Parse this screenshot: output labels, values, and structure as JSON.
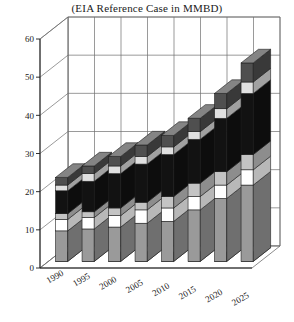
{
  "chart_data": {
    "type": "bar",
    "title": "(EIA Reference Case in MMBD)",
    "subtitle": "",
    "xlabel": "",
    "ylabel": "",
    "ylim": [
      0,
      60
    ],
    "yticks": [
      0,
      10,
      20,
      30,
      40,
      50,
      60
    ],
    "ytick_labels": [
      "0",
      "10",
      "20",
      "30",
      "40",
      "50",
      "60"
    ],
    "grid": true,
    "grid_axis": "y",
    "legend": "none",
    "stacked": true,
    "three_d": true,
    "orientation": "vertical",
    "categories": [
      "1990",
      "1995",
      "2000",
      "2005",
      "2010",
      "2015",
      "2020",
      "2025"
    ],
    "category_label_rotation": -30,
    "series": [
      {
        "name": "segment-1",
        "color": "#9a9a9a",
        "values": [
          8.0,
          8.5,
          9.0,
          10.0,
          10.5,
          13.5,
          16.5,
          20.0
        ]
      },
      {
        "name": "segment-2",
        "color": "#ffffff",
        "values": [
          3.0,
          3.0,
          3.0,
          3.5,
          3.5,
          3.5,
          3.5,
          4.0
        ]
      },
      {
        "name": "segment-3",
        "color": "#c4c4c4",
        "values": [
          1.5,
          1.5,
          2.0,
          2.0,
          3.0,
          3.5,
          3.5,
          4.0
        ]
      },
      {
        "name": "segment-4",
        "color": "#121212",
        "values": [
          6.0,
          8.0,
          9.0,
          10.0,
          11.0,
          11.5,
          14.0,
          16.0
        ]
      },
      {
        "name": "segment-5",
        "color": "#e0e0e0",
        "values": [
          1.5,
          2.0,
          2.0,
          2.0,
          2.0,
          2.0,
          2.5,
          3.0
        ]
      },
      {
        "name": "segment-6",
        "color": "#4f4f4f",
        "values": [
          2.0,
          2.0,
          2.5,
          3.0,
          3.0,
          3.5,
          4.0,
          5.0
        ]
      }
    ],
    "totals": [
      22.0,
      25.0,
      27.5,
      30.5,
      33.0,
      37.5,
      44.0,
      52.0
    ]
  },
  "axes": {
    "y_axis_name": "y-axis",
    "x_axis_name": "x-axis"
  }
}
